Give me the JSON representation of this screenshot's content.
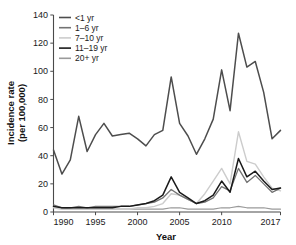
{
  "chart_data": {
    "type": "line",
    "title": "",
    "xlabel": "Year",
    "ylabel": "Incidence rate (per 100,000)",
    "ylabel_line1": "Incidence rate",
    "ylabel_line2": "(per 100,000)",
    "xlim": [
      1990,
      2017
    ],
    "ylim": [
      0,
      140
    ],
    "yticks": [
      0,
      20,
      40,
      60,
      80,
      100,
      120,
      140
    ],
    "ytick_labels": [
      "0",
      "20",
      "40",
      "60",
      "80",
      "100",
      "120",
      "140"
    ],
    "xticks": [
      1990,
      1995,
      2000,
      2005,
      2010,
      2017
    ],
    "xtick_labels": [
      "1990",
      "1995",
      "2000",
      "2005",
      "2010",
      "2017"
    ],
    "grid": false,
    "legend_position": "top-left",
    "x": [
      1990,
      1991,
      1992,
      1993,
      1994,
      1995,
      1996,
      1997,
      1998,
      1999,
      2000,
      2001,
      2002,
      2003,
      2004,
      2005,
      2006,
      2007,
      2008,
      2009,
      2010,
      2011,
      2012,
      2013,
      2014,
      2015,
      2016,
      2017
    ],
    "series": [
      {
        "name": "<1 yr",
        "color": "#4d4d4d",
        "width": 1.5,
        "values": [
          44,
          27,
          37,
          68,
          43,
          55,
          63,
          54,
          55,
          56,
          52,
          47,
          55,
          58,
          96,
          63,
          54,
          41,
          52,
          66,
          101,
          72,
          127,
          103,
          107,
          85,
          52,
          58
        ]
      },
      {
        "name": "1–6 yr",
        "color": "#737373",
        "width": 1.3,
        "values": [
          5,
          3,
          3,
          4,
          3,
          4,
          4,
          4,
          4,
          4,
          5,
          6,
          7,
          10,
          16,
          12,
          9,
          6,
          7,
          10,
          18,
          15,
          31,
          21,
          26,
          20,
          14,
          17
        ]
      },
      {
        "name": "7–10 yr",
        "color": "#cccccc",
        "width": 1.4,
        "values": [
          3,
          2,
          2,
          2,
          2,
          2,
          2,
          2,
          2,
          2,
          3,
          3,
          4,
          6,
          13,
          12,
          9,
          6,
          13,
          22,
          31,
          20,
          57,
          36,
          34,
          25,
          17,
          15
        ]
      },
      {
        "name": "11–19 yr",
        "color": "#1a1a1a",
        "width": 1.5,
        "values": [
          4,
          3,
          3,
          3,
          3,
          3,
          3,
          3,
          4,
          4,
          5,
          6,
          8,
          12,
          25,
          14,
          10,
          6,
          8,
          12,
          22,
          14,
          38,
          25,
          29,
          22,
          16,
          17
        ]
      },
      {
        "name": "20+ yr",
        "color": "#9a9a9a",
        "width": 1.2,
        "values": [
          4,
          3,
          2,
          2,
          2,
          2,
          2,
          2,
          2,
          2,
          2,
          2,
          2,
          2,
          3,
          3,
          2,
          2,
          2,
          2,
          3,
          3,
          4,
          3,
          3,
          3,
          2,
          2
        ]
      }
    ],
    "legend_entries": [
      {
        "label": "<1 yr",
        "color": "#4d4d4d",
        "width": 1.7
      },
      {
        "label": "1–6 yr",
        "color": "#737373",
        "width": 1.4
      },
      {
        "label": "7–10 yr",
        "color": "#cccccc",
        "width": 1.5
      },
      {
        "label": "11–19 yr",
        "color": "#1a1a1a",
        "width": 1.8
      },
      {
        "label": "20+ yr",
        "color": "#9a9a9a",
        "width": 1.3
      }
    ]
  }
}
